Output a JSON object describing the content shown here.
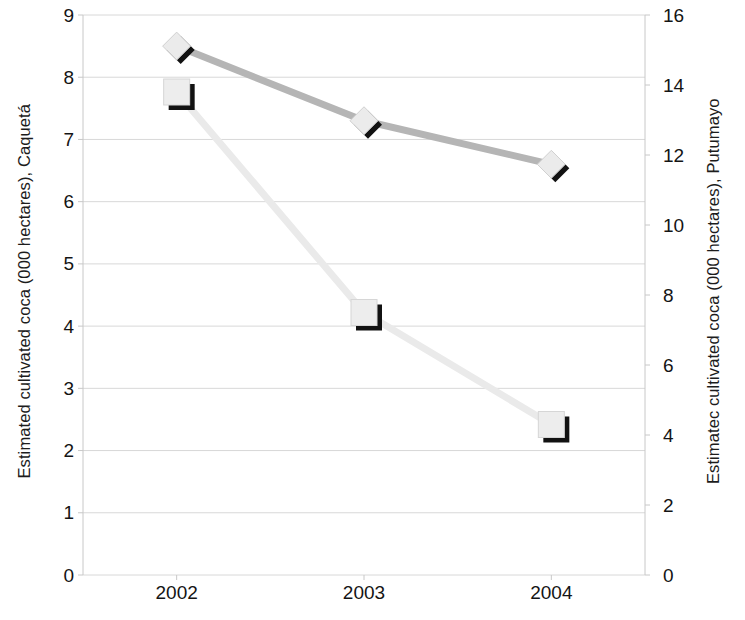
{
  "chart_data": {
    "type": "line",
    "title": "",
    "subtitle": "",
    "xlabel": "",
    "categories": [
      "2002",
      "2003",
      "2004"
    ],
    "grid": true,
    "legend_position": "none",
    "axes": {
      "left": {
        "label": "Estimated cultivated coca (000 hectares), Caquetá",
        "ticks": [
          "9",
          "8",
          "7",
          "6",
          "5",
          "4",
          "3",
          "2",
          "1",
          "0"
        ],
        "tick_values": [
          9,
          8,
          7,
          6,
          5,
          4,
          3,
          2,
          1,
          0
        ],
        "ylim": [
          0,
          9
        ]
      },
      "right": {
        "label": "Estimatec cultivated coca (000 hectares), Putumayo",
        "ticks": [
          "16",
          "14",
          "12",
          "10",
          "8",
          "6",
          "4",
          "2",
          "0"
        ],
        "tick_values": [
          16,
          14,
          12,
          10,
          8,
          6,
          4,
          2,
          0
        ],
        "ylim": [
          0,
          16
        ]
      }
    },
    "series": [
      {
        "name": "Caquetá",
        "axis": "left",
        "marker": "diamond",
        "line_color": "#b5b5b5",
        "marker_fill": "#ebebeb",
        "marker_shadow": "#121212",
        "values": [
          8.5,
          7.3,
          6.6
        ]
      },
      {
        "name": "Putumayo",
        "axis": "right",
        "marker": "square",
        "line_color": "#eaeaea",
        "marker_fill": "#ededed",
        "marker_shadow": "#121212",
        "values": [
          13.8,
          7.5,
          4.3
        ]
      }
    ],
    "colors": {
      "grid": "#d8d8d8",
      "axis": "#c8c8c8",
      "text": "#141414",
      "background": "#ffffff"
    }
  }
}
